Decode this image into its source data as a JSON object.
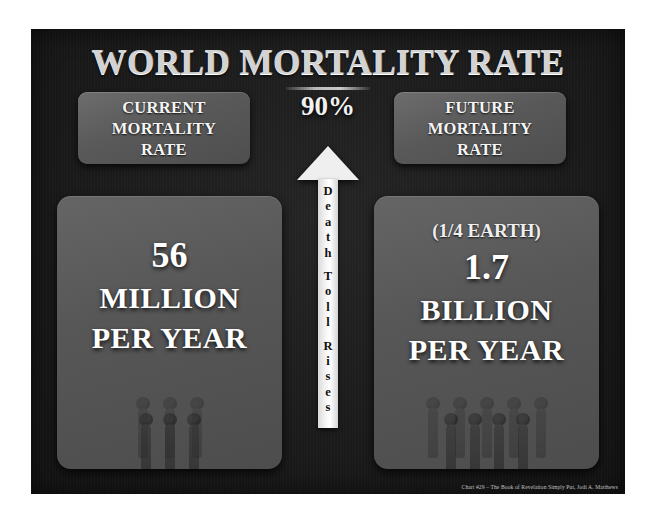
{
  "chart_data": {
    "type": "table",
    "title": "WORLD MORTALITY RATE",
    "annotations": [
      "90%",
      "Death Toll Rises",
      "(1/4 EARTH)"
    ],
    "categories": [
      "CURRENT MORTALITY RATE",
      "FUTURE MORTALITY RATE"
    ],
    "values": [
      56000000,
      1700000000
    ],
    "value_labels": [
      "56 MILLION PER YEAR",
      "1.7 BILLION PER YEAR"
    ],
    "increase_percent": 90,
    "source": "Chart #29 – The Book of Revelation Simply Put, Jodi A. Matthews"
  },
  "panel": {
    "title": "WORLD MORTALITY RATE",
    "percent": "90%",
    "credit": "Chart #29 – The Book of Revelation Simply Put, Jodi A. Matthews"
  },
  "arrow": {
    "label": "Death Toll Rises",
    "word1": "Death",
    "word2": "Toll",
    "word3": "Rises"
  },
  "left": {
    "header": {
      "line1": "CURRENT",
      "line2": "MORTALITY",
      "line3": "RATE"
    },
    "stat": {
      "note": "",
      "number": "56",
      "unit1": "MILLION",
      "unit2": "PER YEAR"
    }
  },
  "right": {
    "header": {
      "line1": "FUTURE",
      "line2": "MORTALITY",
      "line3": "RATE"
    },
    "stat": {
      "note": "(1/4 EARTH)",
      "number": "1.7",
      "unit1": "BILLION",
      "unit2": "PER YEAR"
    }
  },
  "colors": {
    "panel_bg": "#1b1b1b",
    "box_bg": "#575757",
    "text": "#ffffff",
    "title": "#d2d2d2",
    "arrow": "#f2f2f2"
  }
}
